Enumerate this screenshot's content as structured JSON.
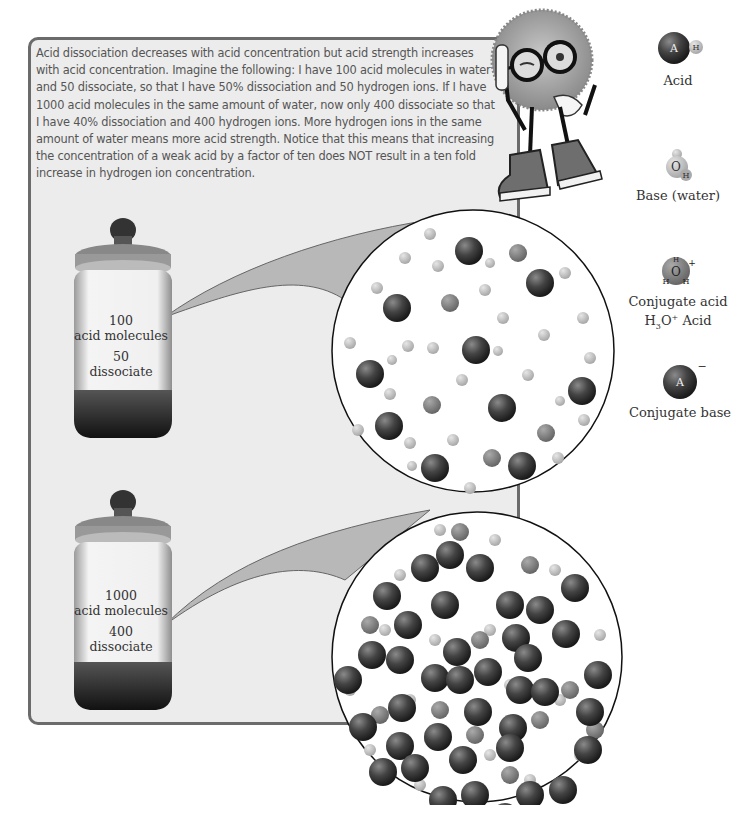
{
  "intro": {
    "text": "Acid dissociation decreases with acid concentration but acid strength increases with acid concentration. Imagine the following: I have 100 acid molecules in water and 50 dissociate, so that I have 50% dissociation and 50 hydrogen ions. If I have 1000 acid molecules in the same amount of water, now only 400 dissociate so that I have 40% dissociation and 400 hydrogen ions. More hydrogen ions in the same amount of water means more acid strength. Notice that this means that increasing the concentration of a weak acid by a factor of ten does NOT result in a ten fold increase in hydrogen ion concentration."
  },
  "jars": [
    {
      "count": "100",
      "count_label": "acid molecules",
      "dissociated": "50",
      "dissociated_label": "dissociate"
    },
    {
      "count": "1000",
      "count_label": "acid molecules",
      "dissociated": "400",
      "dissociated_label": "dissociate"
    }
  ],
  "legend": {
    "acid": {
      "label": "Acid",
      "atom_a": "A",
      "atom_h": "H"
    },
    "base": {
      "label": "Base (water)",
      "atom_o": "O",
      "atom_h": "H"
    },
    "conjugate_acid": {
      "label": "Conjugate acid",
      "formula_h": "H",
      "formula_sub": "3",
      "formula_o": "O",
      "formula_sup": "+",
      "formula_suffix": " Acid",
      "charge": "+"
    },
    "conjugate_base": {
      "label": "Conjugate base",
      "atom_a": "A",
      "charge": "−"
    }
  },
  "colors": {
    "panel_bg": "#ececec",
    "panel_border": "#6b6b6b",
    "acid_sphere": "#3a3a3a",
    "water_sphere": "#bdbdbd",
    "hydronium": "#8c8c8c"
  }
}
